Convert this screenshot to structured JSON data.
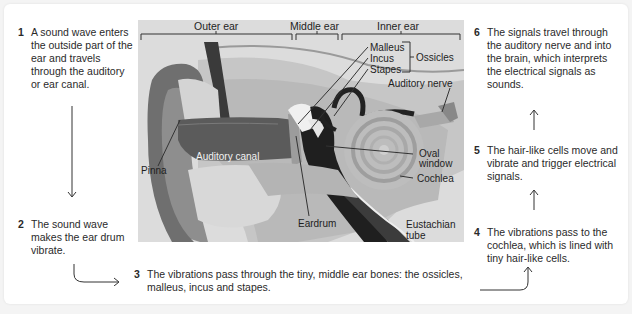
{
  "steps": [
    {
      "num": "1",
      "text": "A sound wave enters the outside part of the ear and travels through the auditory or ear canal."
    },
    {
      "num": "2",
      "text": "The sound wave makes the ear drum vibrate."
    },
    {
      "num": "3",
      "text": "The vibrations pass through the tiny, middle ear bones: the ossicles, malleus, incus and stapes."
    },
    {
      "num": "4",
      "text": "The vibrations pass to the cochlea, which is lined with tiny hair-like cells."
    },
    {
      "num": "5",
      "text": "The hair-like cells move and vibrate and trigger electrical signals."
    },
    {
      "num": "6",
      "text": "The signals travel through the auditory nerve and into the brain, which interprets the electrical signals as sounds."
    }
  ],
  "illustration": {
    "regions": [
      "Outer ear",
      "Middle ear",
      "Inner ear"
    ],
    "labels": {
      "malleus": "Malleus",
      "incus": "Incus",
      "stapes": "Stapes",
      "ossicles": "Ossicles",
      "auditory_nerve": "Auditory nerve",
      "pinna": "Pinna",
      "auditory_canal": "Auditory canal",
      "oval_window_1": "Oval",
      "oval_window_2": "window",
      "cochlea": "Cochlea",
      "eardrum": "Eardrum",
      "eustachian_1": "Eustachian",
      "eustachian_2": "tube"
    }
  },
  "colors": {
    "background": "#f4f4f4",
    "card": "#ffffff",
    "illustration_bg": "#dcdcdc",
    "text": "#2a2a2a"
  }
}
